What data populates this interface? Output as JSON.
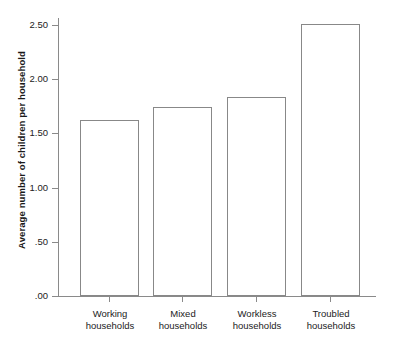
{
  "chart_data": {
    "type": "bar",
    "title": "",
    "xlabel": "",
    "ylabel": "Average number of children per household",
    "categories": [
      "Working households",
      "Mixed households",
      "Workless households",
      "Troubled households"
    ],
    "category_lines": [
      [
        "Working",
        "households"
      ],
      [
        "Mixed",
        "households"
      ],
      [
        "Workless",
        "households"
      ],
      [
        "Troubled",
        "households"
      ]
    ],
    "values": [
      1.62,
      1.74,
      1.84,
      2.51
    ],
    "ylim": [
      0.0,
      2.6
    ],
    "ytick_values": [
      0.0,
      0.5,
      1.0,
      1.5,
      2.0,
      2.5
    ],
    "ytick_labels": [
      ".00",
      ".50",
      "1.00",
      "1.50",
      "2.00",
      "2.50"
    ],
    "grid": false,
    "legend": "none",
    "bar_fill": "#ffffff",
    "bar_stroke": "#888888",
    "axis_color": "#8a8a8a",
    "text_color": "#222222"
  }
}
